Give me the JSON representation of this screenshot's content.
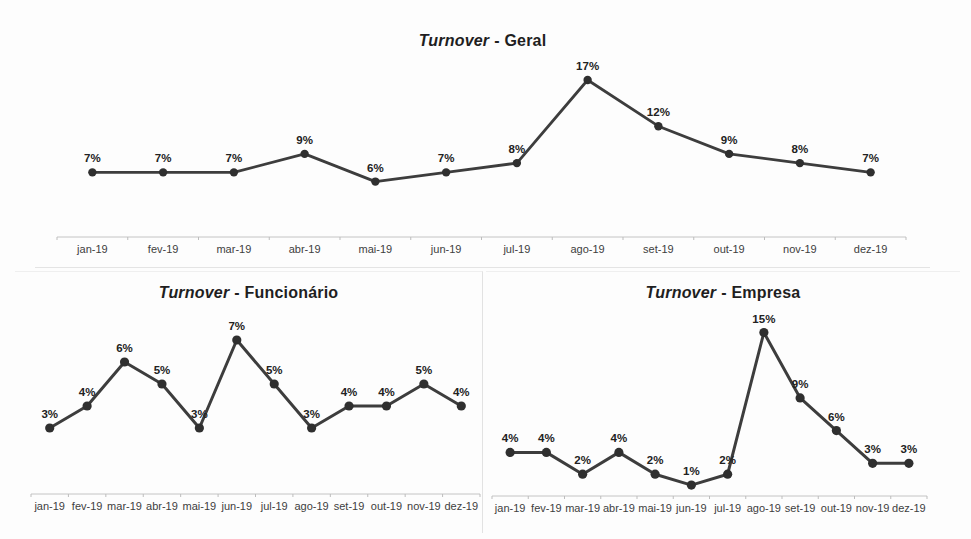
{
  "page": {
    "background": "#fdfdfd"
  },
  "chart_data": [
    {
      "type": "line",
      "title": "Turnover - Geral",
      "title_em": "Turnover",
      "title_rest": "- Geral",
      "categories": [
        "jan-19",
        "fev-19",
        "mar-19",
        "abr-19",
        "mai-19",
        "jun-19",
        "jul-19",
        "ago-19",
        "set-19",
        "out-19",
        "nov-19",
        "dez-19"
      ],
      "values": [
        7,
        7,
        7,
        9,
        6,
        7,
        8,
        17,
        12,
        9,
        8,
        7
      ],
      "data_labels": [
        "7%",
        "7%",
        "7%",
        "9%",
        "6%",
        "7%",
        "8%",
        "17%",
        "12%",
        "9%",
        "8%",
        "7%"
      ],
      "unit": "%",
      "xlabel": "",
      "ylabel": "",
      "ylim": [
        0,
        18
      ],
      "grid": false,
      "legend": "none",
      "colors": {
        "line": "#3d3d3d",
        "marker": "#2f2f2f",
        "data_label": "#222222",
        "axis_line": "#c4c4c4",
        "tick": "#bdbdbd",
        "axis_label": "#404040"
      }
    },
    {
      "type": "line",
      "title": "Turnover - Funcionário",
      "title_em": "Turnover",
      "title_rest": "- Funcionário",
      "categories": [
        "jan-19",
        "fev-19",
        "mar-19",
        "abr-19",
        "mai-19",
        "jun-19",
        "jul-19",
        "ago-19",
        "set-19",
        "out-19",
        "nov-19",
        "dez-19"
      ],
      "values": [
        3,
        4,
        6,
        5,
        3,
        7,
        5,
        3,
        4,
        4,
        5,
        4
      ],
      "data_labels": [
        "3%",
        "4%",
        "6%",
        "5%",
        "3%",
        "7%",
        "5%",
        "3%",
        "4%",
        "4%",
        "5%",
        "4%"
      ],
      "unit": "%",
      "xlabel": "",
      "ylabel": "",
      "ylim": [
        0,
        8
      ],
      "grid": false,
      "legend": "none",
      "colors": {
        "line": "#3d3d3d",
        "marker": "#2f2f2f",
        "data_label": "#222222",
        "axis_line": "#c4c4c4",
        "tick": "#bdbdbd",
        "axis_label": "#404040"
      }
    },
    {
      "type": "line",
      "title": "Turnover - Empresa",
      "title_em": "Turnover",
      "title_rest": "- Empresa",
      "categories": [
        "jan-19",
        "fev-19",
        "mar-19",
        "abr-19",
        "mai-19",
        "jun-19",
        "jul-19",
        "ago-19",
        "set-19",
        "out-19",
        "nov-19",
        "dez-19"
      ],
      "values": [
        4,
        4,
        2,
        4,
        2,
        1,
        2,
        15,
        9,
        6,
        3,
        3
      ],
      "data_labels": [
        "4%",
        "4%",
        "2%",
        "4%",
        "2%",
        "1%",
        "2%",
        "15%",
        "9%",
        "6%",
        "3%",
        "3%"
      ],
      "unit": "%",
      "xlabel": "",
      "ylabel": "",
      "ylim": [
        0,
        16
      ],
      "grid": false,
      "legend": "none",
      "colors": {
        "line": "#3d3d3d",
        "marker": "#2f2f2f",
        "data_label": "#222222",
        "axis_line": "#c4c4c4",
        "tick": "#bdbdbd",
        "axis_label": "#404040"
      }
    }
  ]
}
